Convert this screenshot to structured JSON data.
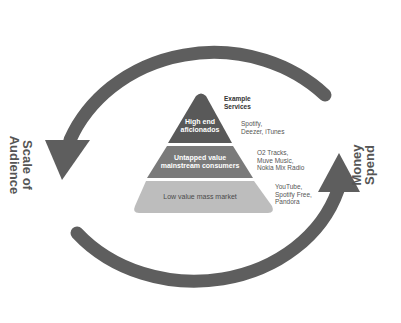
{
  "diagram": {
    "left_axis_label": [
      "Scale of",
      "Audience"
    ],
    "right_axis_label": [
      "Money",
      "Spend"
    ],
    "services_header": [
      "Example",
      "Services"
    ],
    "tiers": [
      {
        "label": [
          "High end",
          "aficionados"
        ],
        "services": [
          "Spotify,",
          "Deezer, iTunes"
        ],
        "color": "#595959"
      },
      {
        "label": [
          "Untapped value",
          "mainstream consumers"
        ],
        "services": [
          "O2 Tracks,",
          "Muve Music,",
          "Nokia Mix Radio"
        ],
        "color": "#7a7a7a"
      },
      {
        "label": [
          "Low value mass market"
        ],
        "services": [
          "YouTube,",
          "Spotify Free,",
          "Pandora"
        ],
        "color": "#bdbdbd"
      }
    ],
    "colors": {
      "arrow": "#5e5e5e",
      "background": "#ffffff"
    }
  }
}
